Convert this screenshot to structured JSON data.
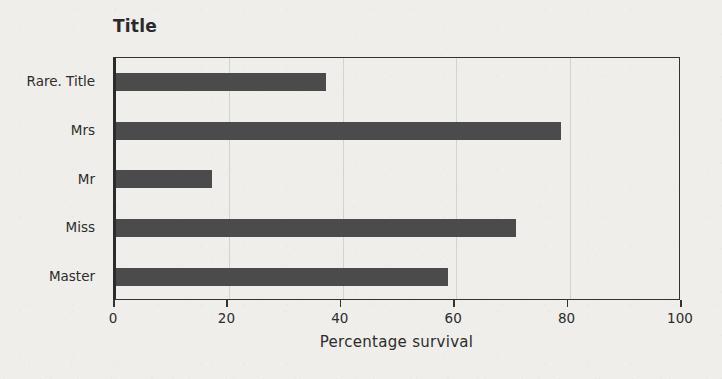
{
  "chart_data": {
    "type": "bar",
    "orientation": "horizontal",
    "title": "Title",
    "xlabel": "Percentage survival",
    "ylabel": "",
    "categories": [
      "Master",
      "Miss",
      "Mr",
      "Mrs",
      "Rare. Title"
    ],
    "values": [
      58.5,
      70.5,
      17.0,
      78.5,
      37.0
    ],
    "series": [
      {
        "name": "Percentage survival",
        "values": [
          58.5,
          70.5,
          17.0,
          78.5,
          37.0
        ]
      }
    ],
    "xlim": [
      0,
      100
    ],
    "xticks": [
      0,
      20,
      40,
      60,
      80,
      100
    ],
    "xtick_labels": [
      "0",
      "20",
      "40",
      "60",
      "80",
      "100"
    ],
    "ytick_labels_top_to_bottom": [
      "Rare. Title",
      "Mrs",
      "Mr",
      "Miss",
      "Master"
    ],
    "grid": "vertical",
    "legend": "none",
    "bar_color": "#4b4b4b",
    "gridline_color": "#d2d2ce",
    "axis_color": "#333333",
    "background_color": "#efeeea",
    "text_color": "#2c2c2c"
  }
}
